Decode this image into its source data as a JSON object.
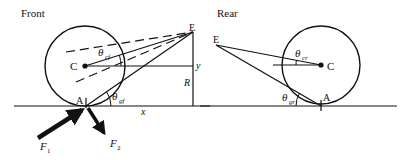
{
  "front": {
    "title": "Front",
    "labels": {
      "C": "C",
      "E": "E",
      "A": "A",
      "y": "y",
      "R": "R",
      "x": "x",
      "theta": "θ",
      "theta_cf_sub": "cf",
      "theta_gf_sub": "gf",
      "F": "F",
      "F1_sub": "1",
      "F2_sub": "2"
    }
  },
  "rear": {
    "title": "Rear",
    "labels": {
      "C": "C",
      "E": "E",
      "A": "A",
      "theta": "θ",
      "theta_cr_sub": "cr",
      "theta_gr_sub": "gr"
    }
  },
  "colors": {
    "ink": "#111111",
    "background": "#ffffff"
  }
}
